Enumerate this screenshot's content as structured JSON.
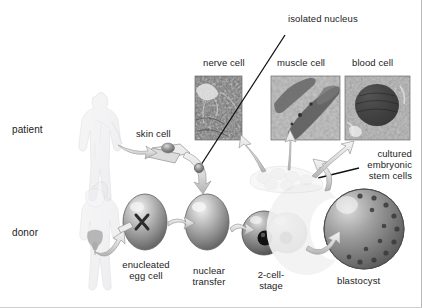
{
  "diagram": {
    "background_color": "#ffffff",
    "text_color": "#1b1b1b",
    "cell_fill": "#8e8e8e",
    "cell_highlight": "#e8e8e8",
    "arrow_fill": "#dcdcdc",
    "arrow_stroke": "#8a8a8a",
    "leader_stroke": "#111111",
    "micrograph_border": "#6d6d6d"
  },
  "row_labels": {
    "patient": "patient",
    "donor": "donor"
  },
  "callouts": {
    "isolated_nucleus": "isolated nucleus",
    "cultured_stem_cells_line1": "cultured",
    "cultured_stem_cells_line2": "embryonic",
    "cultured_stem_cells_line3": "stem cells"
  },
  "micrographs": [
    {
      "label": "nerve cell",
      "name": "nerve-cell-micrograph",
      "x": 195,
      "y": 76,
      "w": 47,
      "h": 64
    },
    {
      "label": "muscle cell",
      "name": "muscle-cell-micrograph",
      "x": 271,
      "y": 76,
      "w": 69,
      "h": 64
    },
    {
      "label": "blood cell",
      "name": "blood-cell-micrograph",
      "x": 345,
      "y": 76,
      "w": 65,
      "h": 64
    }
  ],
  "stages": {
    "skin_cell": "skin cell",
    "enucleated_egg_line1": "enucleated",
    "enucleated_egg_line2": "egg cell",
    "nuclear_transfer_line1": "nuclear",
    "nuclear_transfer_line2": "transfer",
    "two_cell_line1": "2-cell-",
    "two_cell_line2": "stage",
    "blastocyst": "blastocyst"
  }
}
